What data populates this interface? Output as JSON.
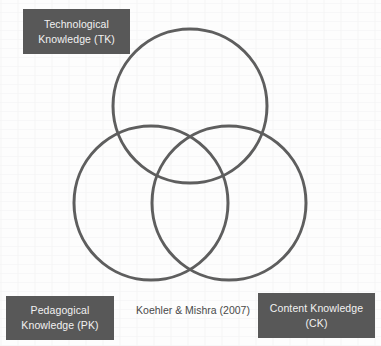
{
  "diagram": {
    "type": "venn-3-circle",
    "background_color": "#fdfdfd",
    "circle_stroke_color": "#5e5e5e",
    "circle_stroke_width": 3,
    "label_box_color": "#585858",
    "label_text_color": "#f2f2f2",
    "citation_text_color": "#4a4a4a"
  },
  "circles": [
    {
      "id": "tk",
      "cx": 190,
      "cy": 106,
      "r": 77
    },
    {
      "id": "pk",
      "cx": 151,
      "cy": 203,
      "r": 77
    },
    {
      "id": "ck",
      "cx": 229,
      "cy": 203,
      "r": 77
    }
  ],
  "labels": {
    "tk": {
      "line1": "Technological",
      "line2": "Knowledge (TK)"
    },
    "pk": {
      "line1": "Pedagogical",
      "line2": "Knowledge (PK)"
    },
    "ck": {
      "line1": "Content Knowledge",
      "line2": "(CK)"
    }
  },
  "citation": {
    "text": "Koehler & Mishra (2007)"
  }
}
